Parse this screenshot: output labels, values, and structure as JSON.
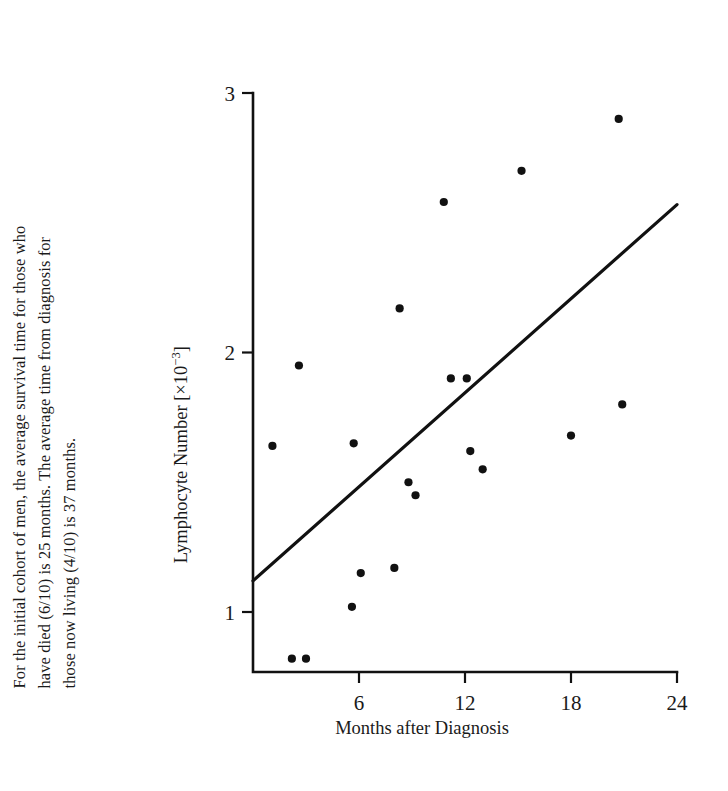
{
  "caption": {
    "line1": "For the initial cohort of men, the average survival time for those who",
    "line2": "have died (6/10) is 25 months.  The average time from diagnosis for",
    "line3": "those now living (4/10) is 37 months."
  },
  "axes": {
    "y_title_main": "Lymphocyte Number [×10",
    "y_title_exponent": "−3",
    "y_title_close": "]",
    "x_title": "Months after Diagnosis"
  },
  "chart_data": {
    "type": "scatter",
    "title": "",
    "xlabel": "Months after Diagnosis",
    "ylabel": "Lymphocyte Number [×10⁻³]",
    "xlim": [
      0,
      24
    ],
    "ylim": [
      0.75,
      3.05
    ],
    "xticks": [
      6,
      12,
      18,
      24
    ],
    "yticks": [
      1,
      2,
      3
    ],
    "xtick_labels": [
      "6",
      "12",
      "18",
      "24"
    ],
    "ytick_labels": [
      "1",
      "2",
      "3"
    ],
    "grid": false,
    "legend": null,
    "points": [
      {
        "x": 1.1,
        "y": 1.64
      },
      {
        "x": 2.2,
        "y": 0.82
      },
      {
        "x": 3.0,
        "y": 0.82
      },
      {
        "x": 2.6,
        "y": 1.95
      },
      {
        "x": 5.6,
        "y": 1.02
      },
      {
        "x": 6.1,
        "y": 1.15
      },
      {
        "x": 5.7,
        "y": 1.65
      },
      {
        "x": 8.0,
        "y": 1.17
      },
      {
        "x": 8.3,
        "y": 2.17
      },
      {
        "x": 8.8,
        "y": 1.5
      },
      {
        "x": 9.2,
        "y": 1.45
      },
      {
        "x": 10.8,
        "y": 2.58
      },
      {
        "x": 11.2,
        "y": 1.9
      },
      {
        "x": 12.1,
        "y": 1.9
      },
      {
        "x": 12.3,
        "y": 1.62
      },
      {
        "x": 13.0,
        "y": 1.55
      },
      {
        "x": 15.2,
        "y": 2.7
      },
      {
        "x": 18.0,
        "y": 1.68
      },
      {
        "x": 20.7,
        "y": 2.9
      },
      {
        "x": 20.9,
        "y": 1.8
      }
    ],
    "fit_line": {
      "type": "linear-regression",
      "x_start": 0.0,
      "y_start": 1.12,
      "x_end": 24.0,
      "y_end": 2.57
    }
  }
}
